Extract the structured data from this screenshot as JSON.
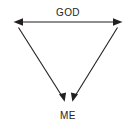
{
  "diagram": {
    "type": "relationship-diagram",
    "background_color": "#ffffff",
    "stroke_color": "#231f20",
    "text_color": "#231f20",
    "nodes": [
      {
        "id": "god",
        "label": "GOD",
        "position": "top-center",
        "x": 68,
        "y": 16
      },
      {
        "id": "me",
        "label": "ME",
        "position": "bottom-center",
        "x": 68,
        "y": 119
      }
    ],
    "connectors": [
      {
        "id": "horizontal-span",
        "name": "god-span-arrow",
        "shape": "horizontal-line",
        "arrowheads": "both",
        "from_x": 14,
        "from_y": 22,
        "to_x": 122,
        "to_y": 22,
        "labelled_by": "god"
      },
      {
        "id": "left-diagonal",
        "name": "left-down-arrow",
        "shape": "diagonal-line",
        "arrowheads": "end",
        "from_x": 18,
        "from_y": 27,
        "to_x": 64,
        "to_y": 101,
        "points_to": "me"
      },
      {
        "id": "right-diagonal",
        "name": "right-down-arrow",
        "shape": "diagonal-line",
        "arrowheads": "end",
        "from_x": 118,
        "from_y": 27,
        "to_x": 73,
        "to_y": 101,
        "points_to": "me"
      }
    ]
  }
}
